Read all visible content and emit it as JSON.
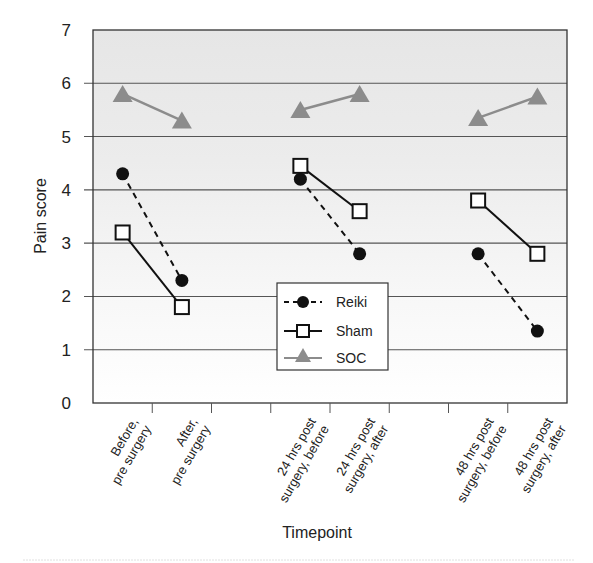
{
  "chart_data": {
    "type": "line",
    "title": "",
    "xlabel": "Timepoint",
    "ylabel": "Pain score",
    "ylim": [
      0,
      7
    ],
    "yticks": [
      0,
      1,
      2,
      3,
      4,
      5,
      6,
      7
    ],
    "grid": true,
    "legend_position": "inside, lower center",
    "categories": [
      "Before, pre surgery",
      "After, pre surgery",
      "",
      "24 hrs post surgery, before",
      "24 hrs post surgery, after",
      "",
      "48 hrs post surgery, before",
      "48 hrs post surgery, after"
    ],
    "category_label_lines": [
      [
        "Before,",
        "pre surgery"
      ],
      [
        "After,",
        "pre surgery"
      ],
      [],
      [
        "24 hrs post",
        "surgery, before"
      ],
      [
        "24 hrs post",
        "surgery, after"
      ],
      [],
      [
        "48 hrs post",
        "surgery, before"
      ],
      [
        "48 hrs post",
        "surgery, after"
      ]
    ],
    "segments": [
      [
        0,
        1
      ],
      [
        3,
        4
      ],
      [
        6,
        7
      ]
    ],
    "series": [
      {
        "name": "Reiki",
        "marker": "circle",
        "line": "dashed",
        "color": "#111111",
        "values": [
          4.3,
          2.3,
          null,
          4.2,
          2.8,
          null,
          2.8,
          1.35
        ]
      },
      {
        "name": "Sham",
        "marker": "square",
        "line": "solid",
        "color": "#111111",
        "values": [
          3.2,
          1.8,
          null,
          4.45,
          3.6,
          null,
          3.8,
          2.8
        ]
      },
      {
        "name": "SOC",
        "marker": "triangle",
        "line": "solid",
        "color": "#8c8c8c",
        "values": [
          5.8,
          5.3,
          null,
          5.5,
          5.8,
          null,
          5.35,
          5.75
        ]
      }
    ]
  },
  "legend": {
    "items": [
      "Reiki",
      "Sham",
      "SOC"
    ]
  }
}
